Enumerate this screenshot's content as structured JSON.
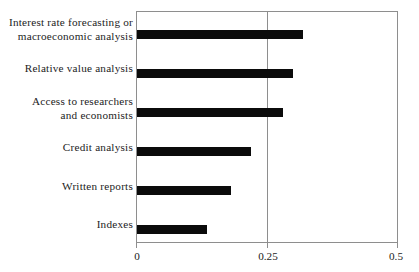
{
  "chart_data": {
    "type": "bar",
    "orientation": "horizontal",
    "title": "",
    "subtitle": "",
    "xlabel": "",
    "ylabel": "",
    "categories": [
      "Interest rate forecasting or\nmacroeconomic analysis",
      "Relative value analysis",
      "Access to researchers\nand economists",
      "Credit analysis",
      "Written reports",
      "Indexes"
    ],
    "values": [
      0.32,
      0.3,
      0.28,
      0.22,
      0.18,
      0.135
    ],
    "xlim": [
      0,
      0.5
    ],
    "xticks": [
      0,
      0.25,
      0.5
    ],
    "xtick_labels": [
      "0",
      "0.25",
      "0.5"
    ],
    "gridlines": [
      "0.25"
    ],
    "grid": true,
    "legend": null,
    "bar_color": "#0b0b0b",
    "frame_color": "#8e8e8e",
    "background_color": "#ffffff"
  },
  "axis": {
    "tick_0": "0",
    "tick_1": "0.25",
    "tick_2": "0.5"
  }
}
